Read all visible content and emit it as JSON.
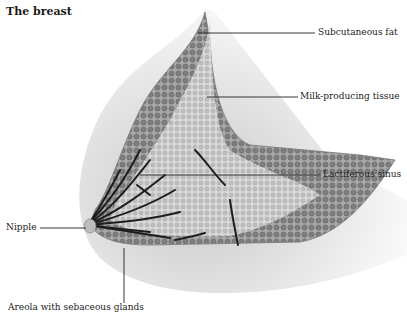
{
  "title": "The breast",
  "labels": {
    "subcutaneous_fat": "Subcutaneous fat",
    "milk_producing_tissue": "Milk-producing tissue",
    "lactiferous_sinus": "Lactiferous sinus",
    "nipple": "Nipple",
    "areola": "Areola with sebaceous glands"
  },
  "colors": {
    "skin_shade": "#d9d9d9",
    "fat_tissue": "#8c8c8c",
    "glandular_tissue": "#c4c4c4",
    "ducts": "#1e1e1e",
    "leader_lines": "#222222"
  }
}
